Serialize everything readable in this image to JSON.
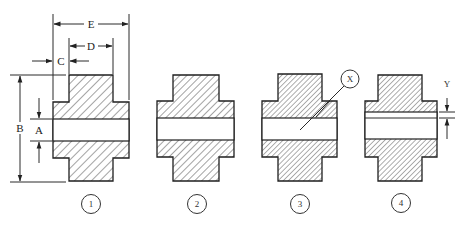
{
  "diagram": {
    "type": "engineering cross-section drawings of hub/coupling parts",
    "figures": [
      {
        "id": "1",
        "label": "1",
        "hatch_spacing": 6
      },
      {
        "id": "2",
        "label": "2",
        "hatch_spacing": 5
      },
      {
        "id": "3",
        "label": "3",
        "hatch_spacing": 4,
        "callout": "X"
      },
      {
        "id": "4",
        "label": "4",
        "hatch_spacing": 4,
        "dimension": "Y"
      }
    ],
    "dimensions": {
      "A": "A",
      "B": "B",
      "C": "C",
      "D": "D",
      "E": "E",
      "X": "X",
      "Y": "Y"
    },
    "colors": {
      "line": "#1f1f1f",
      "background": "#ffffff",
      "hatch": "#333333"
    }
  }
}
